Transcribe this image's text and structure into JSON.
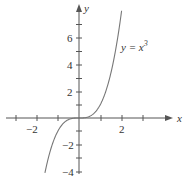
{
  "chart_data": {
    "type": "line",
    "title": "",
    "series": [
      {
        "name": "y = x^3",
        "function": "x^3",
        "x_range": [
          -1.6,
          2.0
        ]
      }
    ],
    "annotation": {
      "text_y": "y = x",
      "text_exp": "3"
    },
    "xlabel": "x",
    "ylabel": "y",
    "x_ticks": [
      -3,
      -2,
      -1,
      0,
      1,
      2,
      3
    ],
    "x_tick_labels": [
      "-2",
      "2"
    ],
    "y_ticks": [
      -4,
      -3,
      -2,
      -1,
      1,
      2,
      3,
      4,
      5,
      6,
      7
    ],
    "y_tick_labels": [
      "6",
      "4",
      "2",
      "-2",
      "-4"
    ],
    "xlim": [
      -3.5,
      4
    ],
    "ylim": [
      -4.3,
      8.5
    ],
    "grid": false,
    "legend": "none"
  },
  "labels": {
    "x_axis": "x",
    "y_axis": "y",
    "tick_x_neg2": "−2",
    "tick_x_2": "2",
    "tick_y_6": "6",
    "tick_y_4": "4",
    "tick_y_2": "2",
    "tick_y_neg2": "−2",
    "tick_y_neg4": "−4",
    "curve_label_main": "y = x",
    "curve_label_exp": "3"
  }
}
